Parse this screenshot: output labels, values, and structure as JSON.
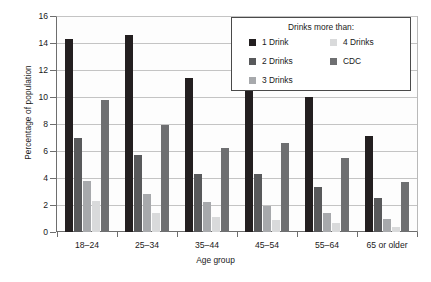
{
  "chart_data": {
    "type": "bar",
    "title": "",
    "xlabel": "Age group",
    "ylabel": "Percentage of population",
    "ylim": [
      0,
      16
    ],
    "ytick_labels": [
      "0",
      "2",
      "4",
      "6",
      "8",
      "10",
      "12",
      "14",
      "16"
    ],
    "ytick_values": [
      0,
      2,
      4,
      6,
      8,
      10,
      12,
      14,
      16
    ],
    "grid": true,
    "legend_position": "top-right-inside",
    "legend_title": "Drinks more than:",
    "categories": [
      "18–24",
      "25–34",
      "35–44",
      "45–54",
      "55–64",
      "65 or older"
    ],
    "series": [
      {
        "name": "1 Drink",
        "color": "#231f20",
        "values": [
          14.3,
          14.6,
          11.4,
          11.5,
          10.0,
          7.1
        ]
      },
      {
        "name": "2 Drinks",
        "color": "#58595b",
        "values": [
          7.0,
          5.7,
          4.3,
          4.3,
          3.3,
          2.5
        ]
      },
      {
        "name": "3 Drinks",
        "color": "#a7a9ac",
        "values": [
          3.8,
          2.8,
          2.2,
          1.9,
          1.4,
          1.0
        ]
      },
      {
        "name": "4 Drinks",
        "color": "#d9dadb",
        "values": [
          2.3,
          1.4,
          1.1,
          0.9,
          0.7,
          0.4
        ]
      },
      {
        "name": "CDC",
        "color": "#6e6f71",
        "values": [
          9.8,
          7.9,
          6.2,
          6.6,
          5.5,
          3.7
        ]
      }
    ]
  },
  "legend": {
    "title": "Drinks more than:",
    "entries": [
      {
        "label": "1 Drink",
        "color": "#231f20",
        "col": 0,
        "row": 0
      },
      {
        "label": "2 Drinks",
        "color": "#58595b",
        "col": 0,
        "row": 1
      },
      {
        "label": "3 Drinks",
        "color": "#a7a9ac",
        "col": 0,
        "row": 2
      },
      {
        "label": "4 Drinks",
        "color": "#d9dadb",
        "col": 1,
        "row": 0
      },
      {
        "label": "CDC",
        "color": "#6e6f71",
        "col": 1,
        "row": 1
      }
    ]
  },
  "axes": {
    "y_title": "Percentage of population",
    "x_title": "Age group"
  }
}
